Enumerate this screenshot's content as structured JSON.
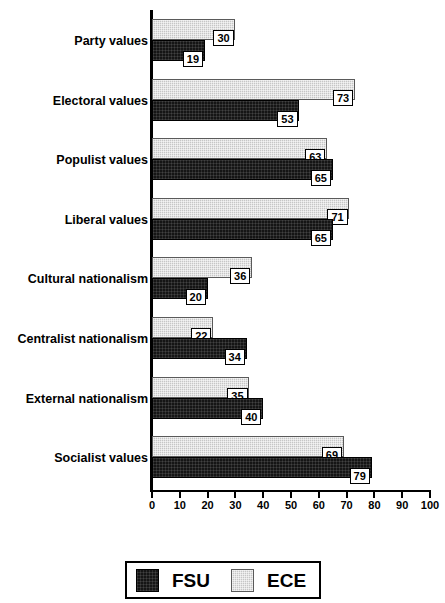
{
  "chart_data": {
    "type": "bar",
    "orientation": "horizontal",
    "title": "",
    "xlabel": "",
    "ylabel": "",
    "xlim": [
      0,
      100
    ],
    "xticks": [
      0,
      10,
      20,
      30,
      40,
      50,
      60,
      70,
      80,
      90,
      100
    ],
    "xtick_labels": [
      "0",
      "10",
      "20",
      "30",
      "40",
      "50",
      "60",
      "70",
      "80",
      "90",
      "100"
    ],
    "grid": false,
    "legend_position": "bottom",
    "data_labels": true,
    "categories": [
      "Party values",
      "Electoral values",
      "Populist values",
      "Liberal values",
      "Cultural nationalism",
      "Centralist nationalism",
      "External nationalism",
      "Socialist values"
    ],
    "series": [
      {
        "name": "ECE",
        "color": "#c6c6c6",
        "values": [
          30,
          73,
          63,
          71,
          36,
          22,
          35,
          69
        ]
      },
      {
        "name": "FSU",
        "color": "#151515",
        "values": [
          19,
          53,
          65,
          65,
          20,
          34,
          40,
          79
        ]
      }
    ]
  },
  "legend": {
    "entries": [
      {
        "label": "FSU",
        "swatch": "fsu"
      },
      {
        "label": "ECE",
        "swatch": "ece"
      }
    ]
  }
}
